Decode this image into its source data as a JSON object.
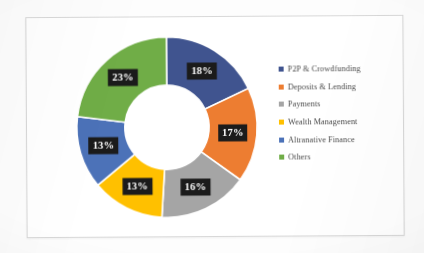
{
  "chart_data": {
    "type": "pie",
    "variant": "donut",
    "title": "",
    "subtitle": "",
    "xlabel": "",
    "ylabel": "",
    "grid": false,
    "legend_position": "right",
    "value_suffix": "%",
    "total": 100,
    "categories": [
      "P2P & Crowdfunding",
      "Deposits & Lending",
      "Payments",
      "Wealth Management",
      "Altranative Finance",
      "Others"
    ],
    "values": [
      18,
      17,
      16,
      13,
      13,
      23
    ],
    "data_labels": [
      "18%",
      "17%",
      "16%",
      "13%",
      "13%",
      "23%"
    ],
    "colors": [
      "#40548F",
      "#ED7D31",
      "#A5A5A5",
      "#FFC000",
      "#4C72B8",
      "#70AD47"
    ],
    "slices": [
      {
        "label": "P2P & Crowdfunding",
        "value": 18,
        "display": "18%",
        "color": "#40548F"
      },
      {
        "label": "Deposits & Lending",
        "value": 17,
        "display": "17%",
        "color": "#ED7D31"
      },
      {
        "label": "Payments",
        "value": 16,
        "display": "16%",
        "color": "#A5A5A5"
      },
      {
        "label": "Wealth Management",
        "value": 13,
        "display": "13%",
        "color": "#FFC000"
      },
      {
        "label": "Altranative Finance",
        "value": 13,
        "display": "13%",
        "color": "#4C72B8"
      },
      {
        "label": "Others",
        "value": 23,
        "display": "23%",
        "color": "#70AD47"
      }
    ]
  },
  "legend": {
    "items": [
      {
        "label": "P2P & Crowdfunding",
        "color": "#40548F"
      },
      {
        "label": "Deposits & Lending",
        "color": "#ED7D31"
      },
      {
        "label": "Payments",
        "color": "#A5A5A5"
      },
      {
        "label": "Wealth Management",
        "color": "#FFC000"
      },
      {
        "label": "Altranative Finance",
        "color": "#4C72B8"
      },
      {
        "label": "Others",
        "color": "#70AD47"
      }
    ]
  }
}
